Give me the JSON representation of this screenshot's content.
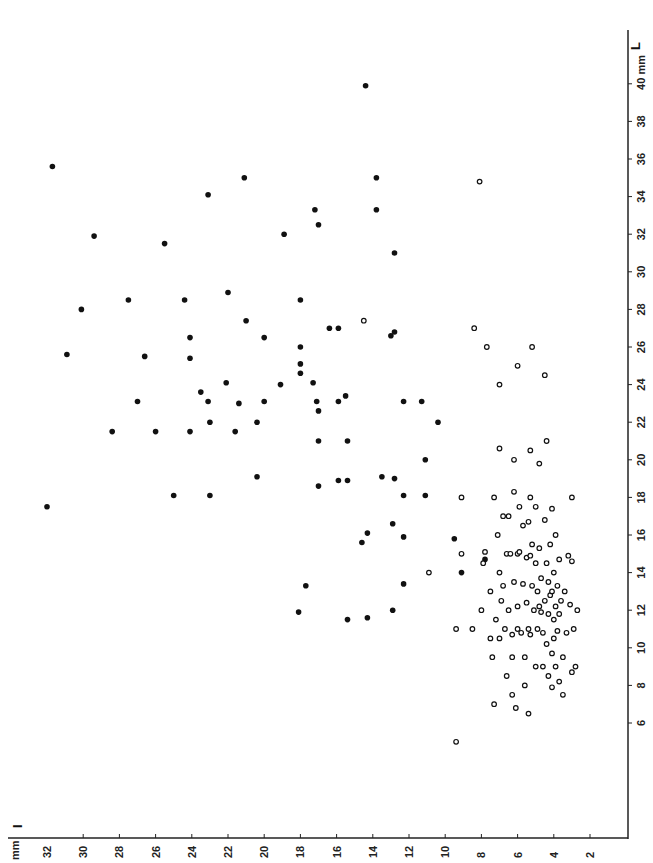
{
  "chart_data": {
    "type": "scatter",
    "title": "",
    "orientation_note": "figure printed rotated 90 degrees",
    "xlabel": "I",
    "x_unit": "mm",
    "ylabel": "L",
    "y_unit": "mm",
    "x_axis": {
      "ticks": [
        32,
        30,
        28,
        26,
        24,
        22,
        20,
        18,
        16,
        14,
        12,
        10,
        8,
        6,
        4,
        2
      ],
      "direction": "decreasing-left-to-right",
      "range": [
        33.5,
        0
      ]
    },
    "y_axis": {
      "ticks": [
        6,
        8,
        10,
        12,
        14,
        16,
        18,
        20,
        22,
        24,
        26,
        28,
        30,
        32,
        34,
        36,
        38,
        40
      ],
      "range": [
        0,
        42.5
      ]
    },
    "grid": false,
    "legend": null,
    "series": [
      {
        "name": "filled",
        "marker": "filled-circle",
        "points": [
          [
            32.0,
            17.5
          ],
          [
            31.7,
            35.6
          ],
          [
            30.9,
            25.6
          ],
          [
            30.1,
            28.0
          ],
          [
            29.4,
            31.9
          ],
          [
            28.4,
            21.5
          ],
          [
            27.5,
            28.5
          ],
          [
            27.0,
            23.1
          ],
          [
            26.6,
            25.5
          ],
          [
            26.0,
            21.5
          ],
          [
            25.5,
            31.5
          ],
          [
            25.0,
            18.1
          ],
          [
            24.4,
            28.5
          ],
          [
            24.1,
            26.5
          ],
          [
            24.1,
            25.4
          ],
          [
            24.1,
            21.5
          ],
          [
            23.5,
            23.6
          ],
          [
            23.1,
            34.1
          ],
          [
            23.1,
            23.1
          ],
          [
            23.0,
            22.0
          ],
          [
            23.0,
            18.1
          ],
          [
            22.1,
            24.1
          ],
          [
            22.0,
            28.9
          ],
          [
            21.6,
            21.5
          ],
          [
            21.4,
            23.0
          ],
          [
            21.1,
            35.0
          ],
          [
            21.0,
            27.4
          ],
          [
            20.4,
            22.0
          ],
          [
            20.4,
            19.1
          ],
          [
            20.0,
            26.5
          ],
          [
            20.0,
            23.1
          ],
          [
            19.1,
            24.0
          ],
          [
            18.9,
            32.0
          ],
          [
            18.0,
            28.5
          ],
          [
            18.0,
            26.0
          ],
          [
            18.0,
            25.1
          ],
          [
            18.0,
            24.6
          ],
          [
            18.1,
            11.9
          ],
          [
            17.7,
            13.3
          ],
          [
            17.3,
            24.1
          ],
          [
            17.2,
            33.3
          ],
          [
            17.1,
            23.1
          ],
          [
            17.0,
            32.5
          ],
          [
            17.0,
            22.6
          ],
          [
            17.0,
            21.0
          ],
          [
            17.0,
            18.6
          ],
          [
            16.4,
            27.0
          ],
          [
            15.9,
            27.0
          ],
          [
            15.9,
            23.1
          ],
          [
            15.9,
            18.9
          ],
          [
            15.5,
            23.4
          ],
          [
            15.4,
            21.0
          ],
          [
            15.4,
            18.9
          ],
          [
            15.4,
            11.5
          ],
          [
            14.6,
            15.6
          ],
          [
            14.4,
            39.9
          ],
          [
            14.3,
            16.1
          ],
          [
            14.3,
            11.6
          ],
          [
            13.8,
            35.0
          ],
          [
            13.8,
            33.3
          ],
          [
            13.5,
            19.1
          ],
          [
            13.0,
            26.6
          ],
          [
            12.8,
            26.8
          ],
          [
            12.8,
            31.0
          ],
          [
            12.9,
            16.6
          ],
          [
            12.8,
            19.0
          ],
          [
            12.9,
            12.0
          ],
          [
            12.3,
            23.1
          ],
          [
            12.3,
            18.1
          ],
          [
            12.3,
            15.9
          ],
          [
            12.3,
            13.4
          ],
          [
            11.3,
            23.1
          ],
          [
            11.1,
            20.0
          ],
          [
            11.1,
            18.1
          ],
          [
            10.4,
            22.0
          ],
          [
            9.5,
            15.8
          ],
          [
            9.1,
            14.0
          ],
          [
            7.8,
            14.7
          ]
        ]
      },
      {
        "name": "open",
        "marker": "open-circle",
        "points": [
          [
            14.5,
            27.4
          ],
          [
            10.9,
            14.0
          ],
          [
            9.4,
            5.0
          ],
          [
            9.4,
            11.0
          ],
          [
            9.1,
            15.0
          ],
          [
            9.1,
            18.0
          ],
          [
            8.5,
            11.0
          ],
          [
            8.4,
            27.0
          ],
          [
            8.1,
            34.8
          ],
          [
            8.0,
            12.0
          ],
          [
            7.9,
            14.5
          ],
          [
            7.8,
            15.1
          ],
          [
            7.7,
            26.0
          ],
          [
            7.5,
            13.0
          ],
          [
            7.5,
            10.5
          ],
          [
            7.4,
            9.5
          ],
          [
            7.3,
            7.0
          ],
          [
            7.3,
            18.0
          ],
          [
            7.2,
            11.5
          ],
          [
            7.1,
            16.0
          ],
          [
            7.0,
            24.0
          ],
          [
            7.0,
            20.6
          ],
          [
            7.0,
            14.0
          ],
          [
            7.0,
            10.5
          ],
          [
            6.9,
            12.5
          ],
          [
            6.8,
            17.0
          ],
          [
            6.8,
            13.3
          ],
          [
            6.7,
            11.0
          ],
          [
            6.6,
            8.5
          ],
          [
            6.6,
            15.0
          ],
          [
            6.5,
            17.0
          ],
          [
            6.5,
            12.0
          ],
          [
            6.4,
            15.0
          ],
          [
            6.3,
            10.7
          ],
          [
            6.3,
            9.5
          ],
          [
            6.3,
            7.5
          ],
          [
            6.2,
            18.3
          ],
          [
            6.2,
            20.0
          ],
          [
            6.2,
            13.5
          ],
          [
            6.1,
            6.8
          ],
          [
            6.0,
            25.0
          ],
          [
            6.0,
            15.0
          ],
          [
            6.0,
            12.2
          ],
          [
            6.0,
            11.0
          ],
          [
            5.9,
            17.5
          ],
          [
            5.9,
            15.1
          ],
          [
            5.8,
            10.8
          ],
          [
            5.7,
            16.5
          ],
          [
            5.7,
            13.4
          ],
          [
            5.6,
            9.5
          ],
          [
            5.6,
            8.0
          ],
          [
            5.5,
            14.8
          ],
          [
            5.5,
            12.4
          ],
          [
            5.4,
            16.7
          ],
          [
            5.4,
            11.0
          ],
          [
            5.4,
            6.5
          ],
          [
            5.3,
            20.5
          ],
          [
            5.3,
            18.0
          ],
          [
            5.3,
            14.9
          ],
          [
            5.3,
            10.7
          ],
          [
            5.2,
            26.0
          ],
          [
            5.2,
            15.5
          ],
          [
            5.2,
            13.3
          ],
          [
            5.1,
            12.0
          ],
          [
            5.0,
            17.5
          ],
          [
            5.0,
            14.5
          ],
          [
            5.0,
            9.0
          ],
          [
            4.9,
            13.0
          ],
          [
            4.9,
            11.0
          ],
          [
            4.8,
            15.3
          ],
          [
            4.8,
            19.8
          ],
          [
            4.8,
            12.2
          ],
          [
            4.7,
            13.7
          ],
          [
            4.7,
            11.9
          ],
          [
            4.6,
            10.8
          ],
          [
            4.6,
            9.0
          ],
          [
            4.5,
            24.5
          ],
          [
            4.5,
            16.8
          ],
          [
            4.5,
            12.5
          ],
          [
            4.4,
            21.0
          ],
          [
            4.4,
            14.5
          ],
          [
            4.4,
            10.2
          ],
          [
            4.3,
            13.5
          ],
          [
            4.3,
            11.8
          ],
          [
            4.3,
            8.5
          ],
          [
            4.2,
            15.5
          ],
          [
            4.2,
            12.8
          ],
          [
            4.1,
            17.4
          ],
          [
            4.1,
            13.0
          ],
          [
            4.1,
            9.7
          ],
          [
            4.1,
            7.9
          ],
          [
            4.0,
            14.0
          ],
          [
            4.0,
            11.5
          ],
          [
            4.0,
            10.5
          ],
          [
            3.9,
            16.0
          ],
          [
            3.9,
            12.2
          ],
          [
            3.9,
            9.0
          ],
          [
            3.8,
            13.3
          ],
          [
            3.8,
            10.9
          ],
          [
            3.7,
            14.7
          ],
          [
            3.7,
            11.8
          ],
          [
            3.7,
            8.2
          ],
          [
            3.6,
            12.5
          ],
          [
            3.5,
            9.5
          ],
          [
            3.5,
            7.5
          ],
          [
            3.4,
            13.0
          ],
          [
            3.3,
            10.8
          ],
          [
            3.2,
            14.9
          ],
          [
            3.1,
            12.3
          ],
          [
            3.0,
            18.0
          ],
          [
            3.0,
            14.6
          ],
          [
            3.0,
            8.7
          ],
          [
            2.9,
            11.0
          ],
          [
            2.8,
            9.0
          ],
          [
            2.7,
            12.0
          ]
        ]
      }
    ]
  },
  "labels": {
    "x_axis_name": "I",
    "x_unit": "mm",
    "y_axis_name": "L",
    "y_unit": "mm"
  }
}
